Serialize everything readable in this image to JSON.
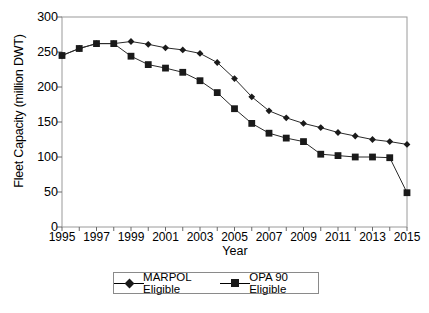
{
  "chart_data": {
    "type": "line",
    "title": "",
    "xlabel": "Year",
    "ylabel": "Fleet Capacity (million DWT)",
    "ylim": [
      0,
      300
    ],
    "xlim": [
      1995,
      2015
    ],
    "ytick_values": [
      0,
      50,
      100,
      150,
      200,
      250,
      300
    ],
    "ytick_labels": [
      "0",
      "50",
      "100",
      "150",
      "200",
      "250",
      "300"
    ],
    "xtick_values": [
      1995,
      1997,
      1999,
      2001,
      2003,
      2005,
      2007,
      2009,
      2011,
      2013,
      2015
    ],
    "xtick_labels": [
      "1995",
      "1997",
      "1999",
      "2001",
      "2003",
      "2005",
      "2007",
      "2009",
      "2011",
      "2013",
      "2015"
    ],
    "minor_xticks_every": 1,
    "grid": false,
    "legend_position": "below-axes",
    "x": [
      1995,
      1996,
      1997,
      1998,
      1999,
      2000,
      2001,
      2002,
      2003,
      2004,
      2005,
      2006,
      2007,
      2008,
      2009,
      2010,
      2011,
      2012,
      2013,
      2014,
      2015
    ],
    "series": [
      {
        "name": "MARPOL Eligible",
        "marker": "diamond",
        "color": "#1a1a1a",
        "values": [
          245,
          255,
          262,
          262,
          265,
          261,
          256,
          253,
          248,
          235,
          212,
          186,
          166,
          156,
          148,
          142,
          135,
          130,
          125,
          122,
          118
        ]
      },
      {
        "name": "OPA 90 Eligible",
        "marker": "square",
        "color": "#1a1a1a",
        "values": [
          245,
          255,
          262,
          262,
          244,
          232,
          227,
          221,
          209,
          192,
          169,
          148,
          134,
          127,
          122,
          104,
          102,
          100,
          100,
          99,
          49
        ]
      }
    ]
  },
  "legend": {
    "items": [
      {
        "label": "MARPOL Eligible",
        "marker": "diamond"
      },
      {
        "label": "OPA 90 Eligible",
        "marker": "square"
      }
    ]
  },
  "axes": {
    "y_title": "Fleet Capacity (million DWT)",
    "x_title": "Year"
  }
}
